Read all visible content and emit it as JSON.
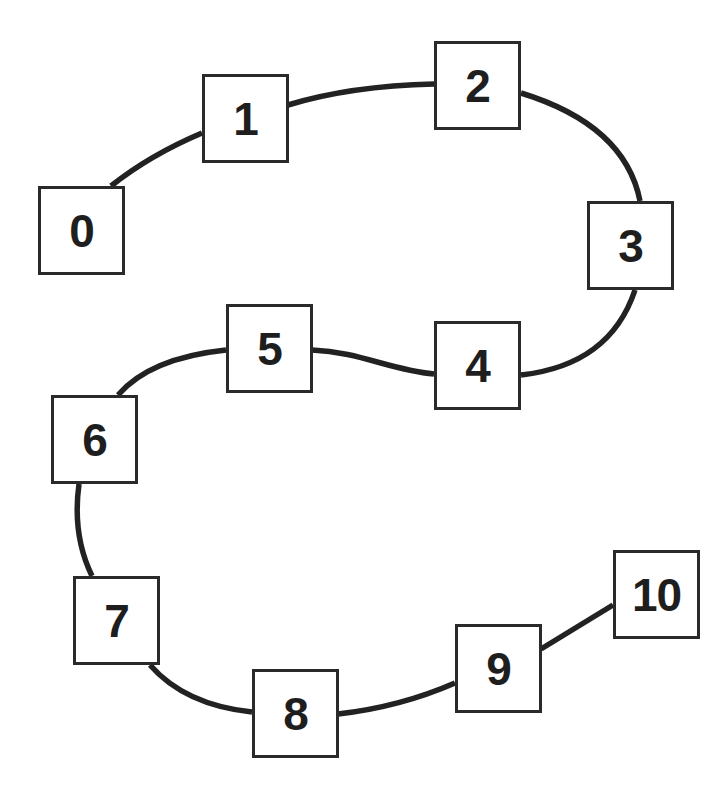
{
  "diagram": {
    "type": "path-graph",
    "colors": {
      "stroke": "#222222",
      "box_border": "#2a2a2a",
      "label": "#1e1e1e",
      "background": "#ffffff"
    },
    "nodes": [
      {
        "id": "0",
        "label": "0",
        "x": 38,
        "y": 186
      },
      {
        "id": "1",
        "label": "1",
        "x": 202,
        "y": 74
      },
      {
        "id": "2",
        "label": "2",
        "x": 434,
        "y": 41
      },
      {
        "id": "3",
        "label": "3",
        "x": 587,
        "y": 201
      },
      {
        "id": "4",
        "label": "4",
        "x": 434,
        "y": 321
      },
      {
        "id": "5",
        "label": "5",
        "x": 226,
        "y": 304
      },
      {
        "id": "6",
        "label": "6",
        "x": 51,
        "y": 395
      },
      {
        "id": "7",
        "label": "7",
        "x": 73,
        "y": 576
      },
      {
        "id": "8",
        "label": "8",
        "x": 252,
        "y": 669
      },
      {
        "id": "9",
        "label": "9",
        "x": 455,
        "y": 624
      },
      {
        "id": "10",
        "label": "10",
        "x": 613,
        "y": 550
      }
    ],
    "edges": [
      {
        "from": "0",
        "to": "1",
        "path": "M111,186 Q150,155 202,133"
      },
      {
        "from": "1",
        "to": "2",
        "path": "M288,105 Q350,86 434,84"
      },
      {
        "from": "2",
        "to": "3",
        "path": "M521,93 Q625,125 640,201"
      },
      {
        "from": "3",
        "to": "4",
        "path": "M635,290 Q610,365 521,375"
      },
      {
        "from": "4",
        "to": "5",
        "path": "M434,374 C390,370 360,352 312,350"
      },
      {
        "from": "5",
        "to": "6",
        "path": "M226,350 Q150,358 118,395"
      },
      {
        "from": "6",
        "to": "7",
        "path": "M79,484 Q72,535 92,576"
      },
      {
        "from": "7",
        "to": "8",
        "path": "M150,665 Q185,705 252,712"
      },
      {
        "from": "8",
        "to": "9",
        "path": "M338,714 Q400,707 455,683"
      },
      {
        "from": "9",
        "to": "10",
        "path": "M541,649 L613,605"
      }
    ]
  }
}
